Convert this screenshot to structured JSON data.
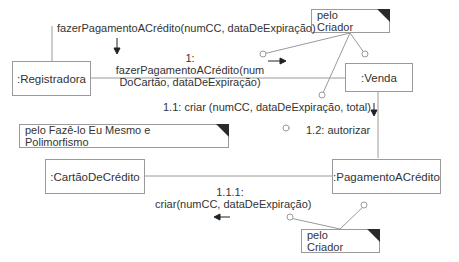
{
  "objects": {
    "registradora": ":Registradora",
    "venda": ":Venda",
    "cartao": ":CartãoDeCrédito",
    "pagamento": ":PagamentoACrédito"
  },
  "notes": {
    "criador_top": "pelo Criador",
    "fazelo": "pelo Fazê-lo Eu Mesmo e Polimorfismo",
    "criador_bottom": "pelo Criador"
  },
  "messages": {
    "external": "fazerPagamentoACrédito(numCC, dataDeExpiração)",
    "m1_num": "1:",
    "m1_line1": "fazerPagamentoACrédito(num",
    "m1_line2": "DoCartão, dataDeExpiração)",
    "m11": "1.1: criar (numCC, dataDeExpiração, total)",
    "m12": "1.2: autorizar",
    "m111_num": "1.1.1:",
    "m111_text": "criar(numCC, dataDeExpiração)"
  }
}
